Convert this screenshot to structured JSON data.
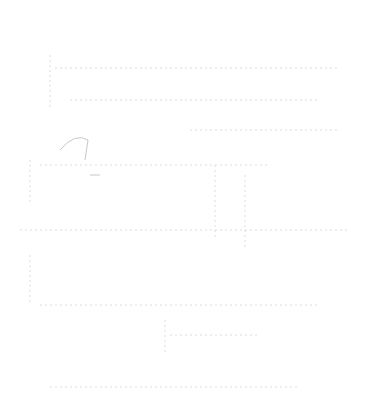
{
  "diagram": {
    "title": "",
    "subtitle": "",
    "note": "Screenshot is heavily faded; labels are illegible",
    "colors": {
      "stroke": "#dcdcdc",
      "text": "#d4d4d4",
      "background": "#ffffff"
    }
  }
}
